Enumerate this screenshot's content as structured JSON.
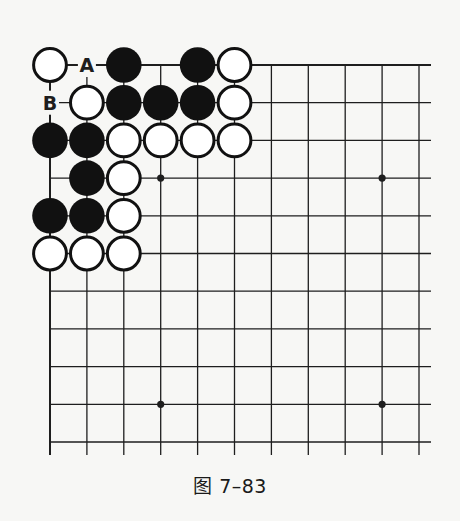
{
  "figure": {
    "caption": "图 7–83",
    "grid": {
      "origin_x": 50,
      "origin_y": 65,
      "col_spacing": 36.9,
      "row_spacing": 37.7,
      "cols": 11,
      "rows": 11,
      "right_extent": 431,
      "bottom_extent": 455,
      "edges": [
        "top",
        "left"
      ]
    },
    "star_points": [
      [
        3,
        3
      ],
      [
        9,
        3
      ],
      [
        3,
        9
      ],
      [
        9,
        9
      ]
    ],
    "stones": [
      {
        "color": "white",
        "col": 0,
        "row": 0
      },
      {
        "color": "black",
        "col": 2,
        "row": 0
      },
      {
        "color": "black",
        "col": 4,
        "row": 0
      },
      {
        "color": "white",
        "col": 5,
        "row": 0
      },
      {
        "color": "white",
        "col": 1,
        "row": 1
      },
      {
        "color": "black",
        "col": 2,
        "row": 1
      },
      {
        "color": "black",
        "col": 3,
        "row": 1
      },
      {
        "color": "black",
        "col": 4,
        "row": 1
      },
      {
        "color": "white",
        "col": 5,
        "row": 1
      },
      {
        "color": "black",
        "col": 0,
        "row": 2
      },
      {
        "color": "black",
        "col": 1,
        "row": 2
      },
      {
        "color": "white",
        "col": 2,
        "row": 2
      },
      {
        "color": "white",
        "col": 3,
        "row": 2
      },
      {
        "color": "white",
        "col": 4,
        "row": 2
      },
      {
        "color": "white",
        "col": 5,
        "row": 2
      },
      {
        "color": "black",
        "col": 1,
        "row": 3
      },
      {
        "color": "white",
        "col": 2,
        "row": 3
      },
      {
        "color": "black",
        "col": 0,
        "row": 4
      },
      {
        "color": "black",
        "col": 1,
        "row": 4
      },
      {
        "color": "white",
        "col": 2,
        "row": 4
      },
      {
        "color": "white",
        "col": 0,
        "row": 5
      },
      {
        "color": "white",
        "col": 1,
        "row": 5
      },
      {
        "color": "white",
        "col": 2,
        "row": 5
      }
    ],
    "labels": [
      {
        "text": "A",
        "col": 1,
        "row": 0
      },
      {
        "text": "B",
        "col": 0,
        "row": 1
      }
    ],
    "colors": {
      "line": "#1e1e1e",
      "black_stone": "#111111",
      "white_stone_fill": "#ffffff",
      "stone_outline": "#111111",
      "background": "#f7f7f5"
    }
  }
}
